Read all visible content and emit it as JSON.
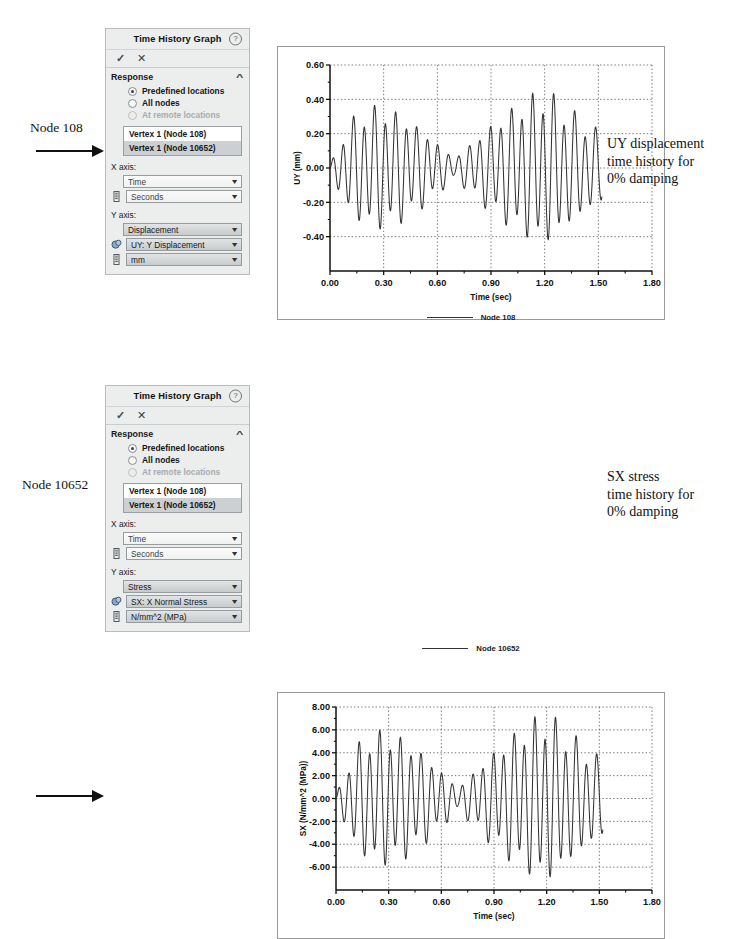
{
  "panels": [
    {
      "title": "Time History Graph",
      "help_icon": "help-icon",
      "accept_icon": "✓",
      "cancel_icon": "✕",
      "section": {
        "label": "Response",
        "collapse_icon": "^"
      },
      "radios": [
        {
          "label": "Predefined locations",
          "selected": true,
          "disabled": false
        },
        {
          "label": "All nodes",
          "selected": false,
          "disabled": false
        },
        {
          "label": "At remote locations",
          "selected": false,
          "disabled": true
        }
      ],
      "list": [
        {
          "label": "Vertex 1 (Node 108)",
          "selected": false
        },
        {
          "label": "Vertex 1 (Node 10652)",
          "selected": true
        }
      ],
      "x_axis_label": "X axis:",
      "x_axis_quantity": "Time",
      "x_axis_units": "Seconds",
      "y_axis_label": "Y axis:",
      "y_axis_quantity": "Displacement",
      "y_axis_component": "UY: Y Displacement",
      "y_axis_units": "mm"
    },
    {
      "title": "Time History Graph",
      "help_icon": "help-icon",
      "accept_icon": "✓",
      "cancel_icon": "✕",
      "section": {
        "label": "Response",
        "collapse_icon": "^"
      },
      "radios": [
        {
          "label": "Predefined locations",
          "selected": true,
          "disabled": false
        },
        {
          "label": "All nodes",
          "selected": false,
          "disabled": false
        },
        {
          "label": "At remote locations",
          "selected": false,
          "disabled": true
        }
      ],
      "list": [
        {
          "label": "Vertex 1 (Node 108)",
          "selected": false
        },
        {
          "label": "Vertex 1 (Node 10652)",
          "selected": true
        }
      ],
      "x_axis_label": "X axis:",
      "x_axis_quantity": "Time",
      "x_axis_units": "Seconds",
      "y_axis_label": "Y axis:",
      "y_axis_quantity": "Stress",
      "y_axis_component": "SX: X Normal Stress",
      "y_axis_units": "N/mm^2 (MPa)"
    }
  ],
  "annotations": {
    "left": [
      "Node 108",
      "Node 10652"
    ],
    "right": [
      "UY displacement\ntime history for\n0% damping",
      "SX stress\ntime history for\n0% damping"
    ],
    "right_1_line1": "UY displacement",
    "right_1_line2": "time history for",
    "right_1_line3": "0% damping",
    "right_2_line1": "SX stress",
    "right_2_line2": "time history for",
    "right_2_line3": "0% damping"
  },
  "chart_data": [
    {
      "type": "line",
      "title": "",
      "xlabel": "Time (sec)",
      "ylabel": "UY (mm)",
      "xlim": [
        0.0,
        1.8
      ],
      "ylim": [
        -0.6,
        0.6
      ],
      "xticks": [
        "0.00",
        "0.30",
        "0.60",
        "0.90",
        "1.20",
        "1.50",
        "1.80"
      ],
      "xtick_values": [
        0.0,
        0.3,
        0.6,
        0.9,
        1.2,
        1.5,
        1.8
      ],
      "yticks": [
        "-0.40",
        "-0.20",
        "0.00",
        "0.20",
        "0.40",
        "0.60"
      ],
      "ytick_values": [
        -0.4,
        -0.2,
        0.0,
        0.2,
        0.4,
        0.6
      ],
      "grid": true,
      "legend": [
        {
          "name": "Node 108",
          "color": "#333333"
        }
      ],
      "legend_position": "bottom",
      "series": [
        {
          "name": "Node 108",
          "color": "#333333",
          "description": "Beat-pattern oscillation, carrier ~17 Hz modulated with beat nodes near t=0.68 and t=1.32, peak amplitude ~0.50 mm",
          "carrier_hz": 17.0,
          "beat_hz": 0.74,
          "amplitude": 0.5,
          "ramp": 0.14
        }
      ]
    },
    {
      "type": "line",
      "title": "",
      "xlabel": "Time (sec)",
      "ylabel": "SX (N/mm^2 (MPa))",
      "xlim": [
        0.0,
        1.8
      ],
      "ylim": [
        -8.0,
        8.0
      ],
      "xticks": [
        "0.00",
        "0.30",
        "0.60",
        "0.90",
        "1.20",
        "1.50",
        "1.80"
      ],
      "xtick_values": [
        0.0,
        0.3,
        0.6,
        0.9,
        1.2,
        1.5,
        1.8
      ],
      "yticks": [
        "-6.00",
        "-4.00",
        "-2.00",
        "0.00",
        "2.00",
        "4.00",
        "6.00",
        "8.00"
      ],
      "ytick_values": [
        -6,
        -4,
        -2,
        0,
        2,
        4,
        6,
        8
      ],
      "grid": true,
      "legend": [
        {
          "name": "Node 10652",
          "color": "#333333"
        }
      ],
      "legend_position": "bottom",
      "series": [
        {
          "name": "Node 10652",
          "color": "#333333",
          "description": "Beat-pattern oscillation matching the UY history, clipped at the -8 MPa axis limit, peak amplitude ~8.2 MPa",
          "carrier_hz": 17.0,
          "beat_hz": 0.74,
          "amplitude": 8.2,
          "ramp": 0.14
        }
      ]
    }
  ]
}
